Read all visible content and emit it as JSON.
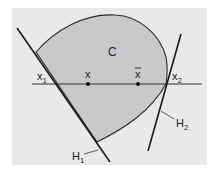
{
  "figure": {
    "panel": {
      "x": 12,
      "y": 8,
      "width": 195,
      "height": 157,
      "fill": "#e9e9ec"
    },
    "region": {
      "label": "C",
      "fill": "#c9c9cc",
      "stroke": "#2a2a2a",
      "label_pos": [
        108,
        56
      ]
    },
    "axis_line": {
      "x1": 32,
      "y1": 84,
      "x2": 202,
      "y2": 84,
      "color": "#333333"
    },
    "hyperplanes": [
      {
        "name": "H1",
        "label": "H",
        "sub": "1",
        "x1": 17,
        "y1": 28,
        "x2": 110,
        "y2": 162,
        "label_pos": [
          72,
          160
        ],
        "leader": [
          84,
          154,
          98,
          150
        ]
      },
      {
        "name": "H2",
        "label": "H",
        "sub": "2",
        "x1": 181,
        "y1": 34,
        "x2": 148,
        "y2": 151,
        "label_pos": [
          176,
          127
        ],
        "leader": [
          161,
          111,
          174,
          119
        ]
      }
    ],
    "points": [
      {
        "name": "x1",
        "label": "x",
        "sub": "1",
        "bar": false,
        "cx": 56,
        "cy": 84,
        "dot": false,
        "label_pos": [
          37,
          80
        ]
      },
      {
        "name": "x",
        "label": "x",
        "sub": "",
        "bar": false,
        "cx": 88,
        "cy": 84,
        "dot": true,
        "label_pos": [
          85,
          78
        ]
      },
      {
        "name": "xbar",
        "label": "x",
        "sub": "",
        "bar": true,
        "cx": 138,
        "cy": 84,
        "dot": true,
        "label_pos": [
          135,
          78
        ]
      },
      {
        "name": "x2",
        "label": "x",
        "sub": "2",
        "bar": false,
        "cx": 166,
        "cy": 84,
        "dot": false,
        "label_pos": [
          172,
          80
        ]
      }
    ]
  }
}
